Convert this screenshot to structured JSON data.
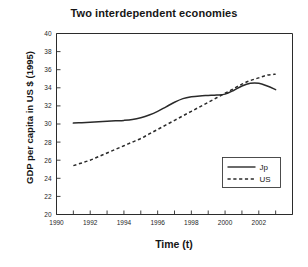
{
  "chart_data": {
    "type": "line",
    "title": "Two interdependent economies",
    "xlabel": "Time (t)",
    "ylabel": "GDP per capita in US $ (1995)",
    "xlim": [
      1990,
      2004
    ],
    "ylim": [
      20,
      40
    ],
    "xticks": [
      1990,
      1991,
      1992,
      1993,
      1994,
      1995,
      1996,
      1997,
      1998,
      1999,
      2000,
      2001,
      2002,
      2003,
      2004
    ],
    "xtick_labels": [
      "1990",
      "",
      "1992",
      "",
      "1994",
      "",
      "1996",
      "",
      "1998",
      "",
      "2000",
      "",
      "2002",
      "",
      ""
    ],
    "yticks": [
      20,
      22,
      24,
      26,
      28,
      30,
      32,
      34,
      36,
      38,
      40
    ],
    "ytick_labels": [
      "20",
      "22",
      "24",
      "26",
      "28",
      "30",
      "32",
      "34",
      "36",
      "38",
      "40"
    ],
    "grid": false,
    "legend_position": "lower right",
    "series": [
      {
        "name": "Jp",
        "style": "solid",
        "x": [
          1991.0,
          1991.5,
          1992.0,
          1992.5,
          1993.0,
          1993.5,
          1994.0,
          1994.5,
          1995.0,
          1995.5,
          1996.0,
          1996.5,
          1997.0,
          1997.5,
          1998.0,
          1998.5,
          1999.0,
          1999.5,
          2000.0,
          2000.5,
          2001.0,
          2001.5,
          2002.0,
          2002.5,
          2003.0
        ],
        "y": [
          30.1,
          30.15,
          30.2,
          30.25,
          30.3,
          30.35,
          30.4,
          30.5,
          30.7,
          31.0,
          31.4,
          31.9,
          32.4,
          32.8,
          33.0,
          33.1,
          33.15,
          33.2,
          33.3,
          33.7,
          34.2,
          34.5,
          34.5,
          34.2,
          33.8
        ]
      },
      {
        "name": "US",
        "style": "dashed",
        "x": [
          1991.0,
          1991.5,
          1992.0,
          1992.5,
          1993.0,
          1993.5,
          1994.0,
          1994.5,
          1995.0,
          1995.5,
          1996.0,
          1996.5,
          1997.0,
          1997.5,
          1998.0,
          1998.5,
          1999.0,
          1999.5,
          2000.0,
          2000.5,
          2001.0,
          2001.5,
          2002.0,
          2002.5,
          2003.0
        ],
        "y": [
          25.4,
          25.7,
          26.0,
          26.4,
          26.8,
          27.2,
          27.6,
          28.0,
          28.4,
          28.9,
          29.4,
          29.9,
          30.4,
          30.9,
          31.4,
          31.9,
          32.4,
          32.9,
          33.4,
          33.9,
          34.4,
          34.8,
          35.1,
          35.4,
          35.5
        ]
      }
    ],
    "annotations": []
  },
  "legend": {
    "entries": [
      {
        "label": "Jp",
        "style": "solid"
      },
      {
        "label": "US",
        "style": "dashed"
      }
    ]
  }
}
